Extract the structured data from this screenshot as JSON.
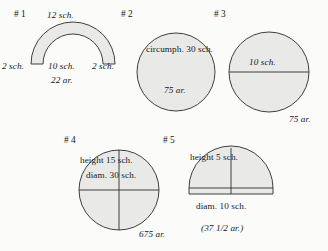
{
  "page": {
    "background_color": "#fbfbfa",
    "shape_fill_color": "#e9e9e7",
    "shape_stroke_color": "#2a2a2a"
  },
  "figures": [
    {
      "id": "fig1",
      "number": "# 1",
      "shape": "annulus-sector-arc",
      "labels": {
        "top": "12 sch.",
        "left": "2 sch.",
        "center": "10 sch.",
        "right": "2 sch.",
        "bottom": "22 ar."
      }
    },
    {
      "id": "fig2",
      "number": "# 2",
      "shape": "circle",
      "labels": {
        "circumference": "circumph. 30 sch.",
        "area": "75 ar."
      }
    },
    {
      "id": "fig3",
      "number": "# 3",
      "shape": "circle-with-diameter",
      "labels": {
        "diameter": "10 sch.",
        "area": "75 ar."
      }
    },
    {
      "id": "fig4",
      "number": "# 4",
      "shape": "circle-with-crosshair",
      "labels": {
        "height": "height 15 sch.",
        "diameter": "diam. 30 sch.",
        "area": "675 ar."
      }
    },
    {
      "id": "fig5",
      "number": "# 5",
      "shape": "semicircle-dome-with-base-strip",
      "labels": {
        "height": "height 5 sch.",
        "diameter": "diam. 10 sch.",
        "area": "(37 1/2 ar.)"
      }
    }
  ]
}
